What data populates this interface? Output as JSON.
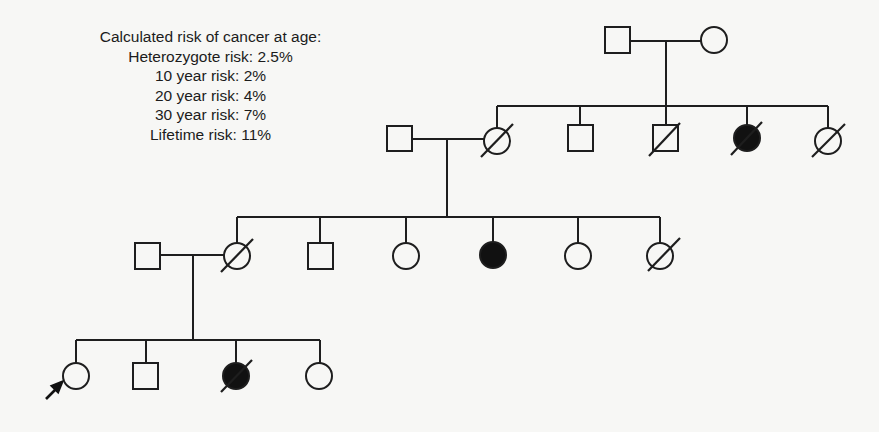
{
  "risk_summary": {
    "title": "Calculated risk of cancer at age:",
    "lines": [
      "Heterozygote risk: 2.5%",
      "10 year risk: 2%",
      "20 year risk: 4%",
      "30 year risk: 7%",
      "Lifetime risk: 11%"
    ]
  },
  "pedigree": {
    "legend_semantics": {
      "square": "male",
      "circle": "female",
      "filled": "affected",
      "slash": "deceased",
      "arrow": "proband"
    },
    "generations": [
      {
        "label": "I",
        "individuals": [
          {
            "id": "I-1",
            "sex": "male",
            "affected": false,
            "deceased": false
          },
          {
            "id": "I-2",
            "sex": "female",
            "affected": false,
            "deceased": false
          }
        ]
      },
      {
        "label": "II",
        "individuals": [
          {
            "id": "II-spouse",
            "sex": "male",
            "affected": false,
            "deceased": false
          },
          {
            "id": "II-1",
            "sex": "female",
            "affected": false,
            "deceased": true
          },
          {
            "id": "II-2",
            "sex": "male",
            "affected": false,
            "deceased": false
          },
          {
            "id": "II-3",
            "sex": "male",
            "affected": false,
            "deceased": true
          },
          {
            "id": "II-4",
            "sex": "female",
            "affected": true,
            "deceased": true
          },
          {
            "id": "II-5",
            "sex": "female",
            "affected": false,
            "deceased": true
          }
        ]
      },
      {
        "label": "III",
        "individuals": [
          {
            "id": "III-spouse",
            "sex": "male",
            "affected": false,
            "deceased": false
          },
          {
            "id": "III-1",
            "sex": "female",
            "affected": false,
            "deceased": true
          },
          {
            "id": "III-2",
            "sex": "male",
            "affected": false,
            "deceased": false
          },
          {
            "id": "III-3",
            "sex": "female",
            "affected": false,
            "deceased": false
          },
          {
            "id": "III-4",
            "sex": "female",
            "affected": true,
            "deceased": false
          },
          {
            "id": "III-5",
            "sex": "female",
            "affected": false,
            "deceased": false
          },
          {
            "id": "III-6",
            "sex": "female",
            "affected": false,
            "deceased": true
          }
        ]
      },
      {
        "label": "IV",
        "individuals": [
          {
            "id": "IV-1",
            "sex": "female",
            "affected": false,
            "deceased": false,
            "proband": true
          },
          {
            "id": "IV-2",
            "sex": "male",
            "affected": false,
            "deceased": false
          },
          {
            "id": "IV-3",
            "sex": "female",
            "affected": true,
            "deceased": true
          },
          {
            "id": "IV-4",
            "sex": "female",
            "affected": false,
            "deceased": false
          }
        ]
      }
    ]
  }
}
